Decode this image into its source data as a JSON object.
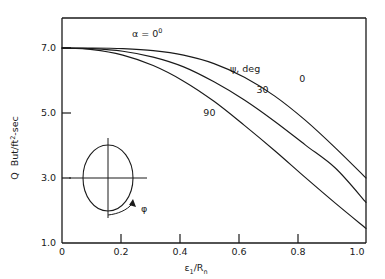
{
  "chart_data": {
    "type": "line",
    "title": "",
    "subtitle": "",
    "annotation_alpha": "α = 0",
    "annotation_alpha_sup": "0",
    "xlabel_eps": "ε",
    "xlabel_eps_sub": "1",
    "xlabel_slash_r": "/R",
    "xlabel_r_sub": "n",
    "ylabel_q": "Q",
    "ylabel_units_a": "But/ft",
    "ylabel_units_sup": "2",
    "ylabel_units_b": "-sec",
    "legend_title_symbol": "ψ",
    "legend_title_rest": ", deg",
    "legend_position": "upper-right-inside",
    "grid": false,
    "xlim": [
      0,
      1.0
    ],
    "ylim": [
      1.0,
      7.0
    ],
    "xticks": [
      "0",
      "0.2",
      "0.4",
      "0.6",
      "0.8",
      "1.0"
    ],
    "xtick_values": [
      0,
      0.2,
      0.4,
      0.6,
      0.8,
      1.0
    ],
    "yticks": [
      "1.0",
      "3.0",
      "5.0",
      "7.0"
    ],
    "ytick_values": [
      1.0,
      3.0,
      5.0,
      7.0
    ],
    "x": [
      0,
      0.1,
      0.2,
      0.3,
      0.4,
      0.5,
      0.6,
      0.7,
      0.8,
      0.9,
      1.0
    ],
    "series": [
      {
        "name": "0",
        "label": "0",
        "label_x": 0.79,
        "label_y": 5.95,
        "values": [
          7.0,
          7.0,
          6.98,
          6.92,
          6.78,
          6.52,
          6.1,
          5.52,
          4.78,
          3.92,
          3.0
        ]
      },
      {
        "name": "30",
        "label": "30",
        "label_x": 0.66,
        "label_y": 5.62,
        "values": [
          7.0,
          6.98,
          6.9,
          6.72,
          6.42,
          5.96,
          5.4,
          4.74,
          4.02,
          3.3,
          2.25
        ]
      },
      {
        "name": "90",
        "label": "90",
        "label_x": 0.485,
        "label_y": 4.92,
        "values": [
          7.0,
          6.95,
          6.78,
          6.46,
          5.98,
          5.36,
          4.62,
          3.84,
          3.02,
          2.22,
          1.45
        ]
      }
    ],
    "inset": {
      "name": "body-cross-section-sketch",
      "phi_label": "φ",
      "description": "ellipse with vertical and horizontal axes and a curved arrow labelled phi"
    }
  }
}
